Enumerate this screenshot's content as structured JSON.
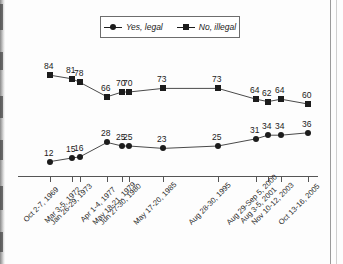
{
  "legend": {
    "entries": [
      {
        "label": "Yes, legal",
        "marker": "circle-marker-icon",
        "color": "#1c1c1c"
      },
      {
        "label": "No, illegal",
        "marker": "square-marker-icon",
        "color": "#1c1c1c"
      }
    ]
  },
  "chart_data": {
    "type": "line",
    "title": "",
    "subtitle": "",
    "xlabel": "",
    "ylabel": "",
    "grid": false,
    "legend_position": "top-center",
    "ylim": [
      0,
      100
    ],
    "categories": [
      "Oct 2-7, 1969",
      "Mar 3-5, 1972",
      "Jan 26-29, 1973",
      "Apr 1-4, 1977",
      "May 18-21, 1979",
      "Jun 27-30, 1980",
      "May 17-20, 1985",
      "Aug 28-30, 1995",
      "Aug 29-Sep 5, 2000",
      "Aug 3-5, 2001",
      "Nov 10-12, 2003",
      "Oct 13-16, 2005"
    ],
    "series": [
      {
        "name": "Yes, legal",
        "marker": "circle",
        "values": [
          12,
          15,
          16,
          28,
          25,
          25,
          23,
          25,
          31,
          34,
          34,
          36
        ]
      },
      {
        "name": "No, illegal",
        "marker": "square",
        "values": [
          84,
          81,
          78,
          66,
          70,
          70,
          73,
          73,
          64,
          62,
          64,
          60
        ]
      }
    ]
  }
}
